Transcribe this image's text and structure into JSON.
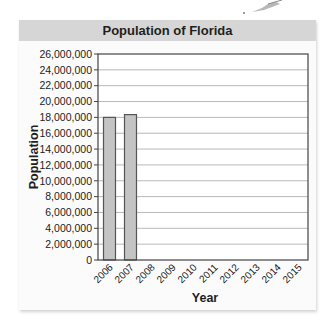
{
  "chart_data": {
    "type": "bar",
    "title": "Population of Florida",
    "xlabel": "Year",
    "ylabel": "Population",
    "categories": [
      "2006",
      "2007",
      "2008",
      "2009",
      "2010",
      "2011",
      "2012",
      "2013",
      "2014",
      "2015"
    ],
    "values": [
      18000000,
      18350000,
      null,
      null,
      null,
      null,
      null,
      null,
      null,
      null
    ],
    "ylim": [
      0,
      26000000
    ],
    "yticks": [
      0,
      2000000,
      4000000,
      6000000,
      8000000,
      10000000,
      12000000,
      14000000,
      16000000,
      18000000,
      20000000,
      22000000,
      24000000,
      26000000
    ],
    "ytick_labels": [
      "0",
      "2,000,000",
      "4,000,000",
      "6,000,000",
      "8,000,000",
      "10,000,000",
      "12,000,000",
      "14,000,000",
      "16,000,000",
      "18,000,000",
      "20,000,000",
      "22,000,000",
      "24,000,000",
      "26,000,000"
    ],
    "grid": true,
    "legend": null,
    "colors": {
      "bar_fill": "#c4c4c4",
      "bar_stroke": "#555555",
      "grid": "#b8b8b8",
      "title_bar": "#d6d6d6"
    }
  },
  "header": {
    "title": "Population of Florida"
  },
  "axes": {
    "x_label": "Year",
    "y_label": "Population"
  }
}
